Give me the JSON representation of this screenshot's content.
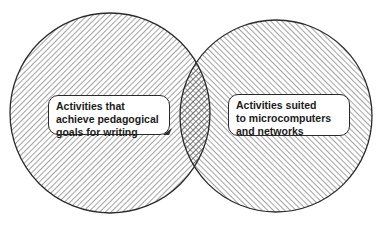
{
  "diagram": {
    "type": "venn",
    "sets": [
      {
        "id": "left",
        "label_lines": [
          "Activities that",
          "achieve pedagogical",
          "goals for writing"
        ],
        "hatch": "diagonal-backslash",
        "cx": 110,
        "cy": 113,
        "r": 100
      },
      {
        "id": "right",
        "label_lines": [
          "Activities suited",
          "to microcomputers",
          "and networks"
        ],
        "hatch": "diagonal-slash",
        "cx": 276,
        "cy": 116,
        "r": 96
      }
    ],
    "intersection": {
      "hatch": "crosshatch"
    },
    "colors": {
      "stroke": "#2a2a2a",
      "hatch": "#555555",
      "background": "#ffffff"
    }
  }
}
